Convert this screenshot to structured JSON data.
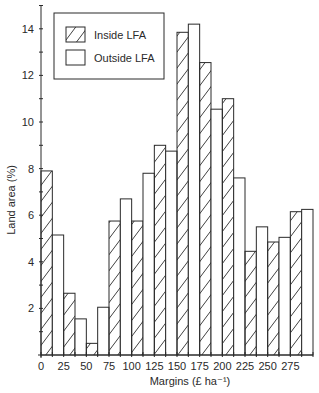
{
  "chart_data": {
    "type": "bar",
    "title": "",
    "xlabel": "Margins (£ ha⁻¹)",
    "ylabel": "Land area (%)",
    "xlim": [
      0,
      300
    ],
    "ylim": [
      0,
      15
    ],
    "bin_width": 12.5,
    "x_ticks": [
      0,
      25,
      50,
      75,
      100,
      125,
      150,
      175,
      200,
      225,
      250,
      275
    ],
    "y_ticks": [
      2,
      4,
      6,
      8,
      10,
      12,
      14
    ],
    "grid": false,
    "legend_position": "upper-left",
    "legend": [
      {
        "name": "Inside LFA",
        "pattern": "hatched"
      },
      {
        "name": "Outside LFA",
        "pattern": "open"
      }
    ],
    "bars": [
      {
        "x0": 0,
        "x1": 12.5,
        "value": 7.9,
        "series": "Inside LFA"
      },
      {
        "x0": 12.5,
        "x1": 25,
        "value": 5.15,
        "series": "Outside LFA"
      },
      {
        "x0": 25,
        "x1": 37.5,
        "value": 2.65,
        "series": "Inside LFA"
      },
      {
        "x0": 37.5,
        "x1": 50,
        "value": 1.55,
        "series": "Outside LFA"
      },
      {
        "x0": 50,
        "x1": 62.5,
        "value": 0.5,
        "series": "Inside LFA"
      },
      {
        "x0": 62.5,
        "x1": 75,
        "value": 2.05,
        "series": "Outside LFA"
      },
      {
        "x0": 75,
        "x1": 87.5,
        "value": 5.75,
        "series": "Inside LFA"
      },
      {
        "x0": 87.5,
        "x1": 100,
        "value": 6.7,
        "series": "Outside LFA"
      },
      {
        "x0": 100,
        "x1": 112.5,
        "value": 5.75,
        "series": "Inside LFA"
      },
      {
        "x0": 112.5,
        "x1": 125,
        "value": 7.8,
        "series": "Outside LFA"
      },
      {
        "x0": 125,
        "x1": 137.5,
        "value": 9.0,
        "series": "Inside LFA"
      },
      {
        "x0": 137.5,
        "x1": 150,
        "value": 8.75,
        "series": "Outside LFA"
      },
      {
        "x0": 150,
        "x1": 162.5,
        "value": 13.85,
        "series": "Inside LFA"
      },
      {
        "x0": 162.5,
        "x1": 175,
        "value": 14.2,
        "series": "Outside LFA"
      },
      {
        "x0": 175,
        "x1": 187.5,
        "value": 12.55,
        "series": "Inside LFA"
      },
      {
        "x0": 187.5,
        "x1": 200,
        "value": 10.55,
        "series": "Outside LFA"
      },
      {
        "x0": 200,
        "x1": 212.5,
        "value": 11.0,
        "series": "Inside LFA"
      },
      {
        "x0": 212.5,
        "x1": 225,
        "value": 7.6,
        "series": "Outside LFA"
      },
      {
        "x0": 225,
        "x1": 237.5,
        "value": 4.45,
        "series": "Inside LFA"
      },
      {
        "x0": 237.5,
        "x1": 250,
        "value": 5.5,
        "series": "Outside LFA"
      },
      {
        "x0": 250,
        "x1": 262.5,
        "value": 4.85,
        "series": "Inside LFA"
      },
      {
        "x0": 262.5,
        "x1": 275,
        "value": 5.05,
        "series": "Outside LFA"
      },
      {
        "x0": 275,
        "x1": 287.5,
        "value": 6.15,
        "series": "Inside LFA"
      },
      {
        "x0": 287.5,
        "x1": 300,
        "value": 6.25,
        "series": "Outside LFA"
      }
    ],
    "series": [
      {
        "name": "Inside LFA",
        "categories": [
          "0-12.5",
          "25-37.5",
          "50-62.5",
          "75-87.5",
          "100-112.5",
          "125-137.5",
          "150-162.5",
          "175-187.5",
          "200-212.5",
          "225-237.5",
          "250-262.5",
          "275-287.5"
        ],
        "values": [
          7.9,
          2.65,
          0.5,
          5.75,
          5.75,
          9.0,
          13.85,
          12.55,
          11.0,
          4.45,
          4.85,
          6.15
        ]
      },
      {
        "name": "Outside LFA",
        "categories": [
          "12.5-25",
          "37.5-50",
          "62.5-75",
          "87.5-100",
          "112.5-125",
          "137.5-150",
          "162.5-175",
          "187.5-200",
          "212.5-225",
          "237.5-250",
          "262.5-275",
          "287.5-300"
        ],
        "values": [
          5.15,
          1.55,
          2.05,
          6.7,
          7.8,
          8.75,
          14.2,
          10.55,
          7.6,
          5.5,
          5.05,
          6.25
        ]
      }
    ]
  },
  "colors": {
    "stroke": "#2a2a2a",
    "background": "#ffffff",
    "hatch": "#2a2a2a"
  }
}
